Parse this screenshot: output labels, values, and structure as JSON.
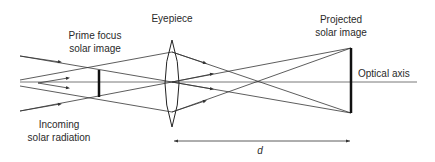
{
  "diagram": {
    "labels": {
      "eyepiece": "Eyepiece",
      "prime_focus_line1": "Prime focus",
      "prime_focus_line2": "solar image",
      "projected_line1": "Projected",
      "projected_line2": "solar image",
      "optical_axis": "Optical axis",
      "incoming_line1": "Incoming",
      "incoming_line2": "solar radiation",
      "distance": "d"
    },
    "colors": {
      "line": "#333333",
      "text": "#2a2a2a",
      "background": "#ffffff"
    }
  }
}
